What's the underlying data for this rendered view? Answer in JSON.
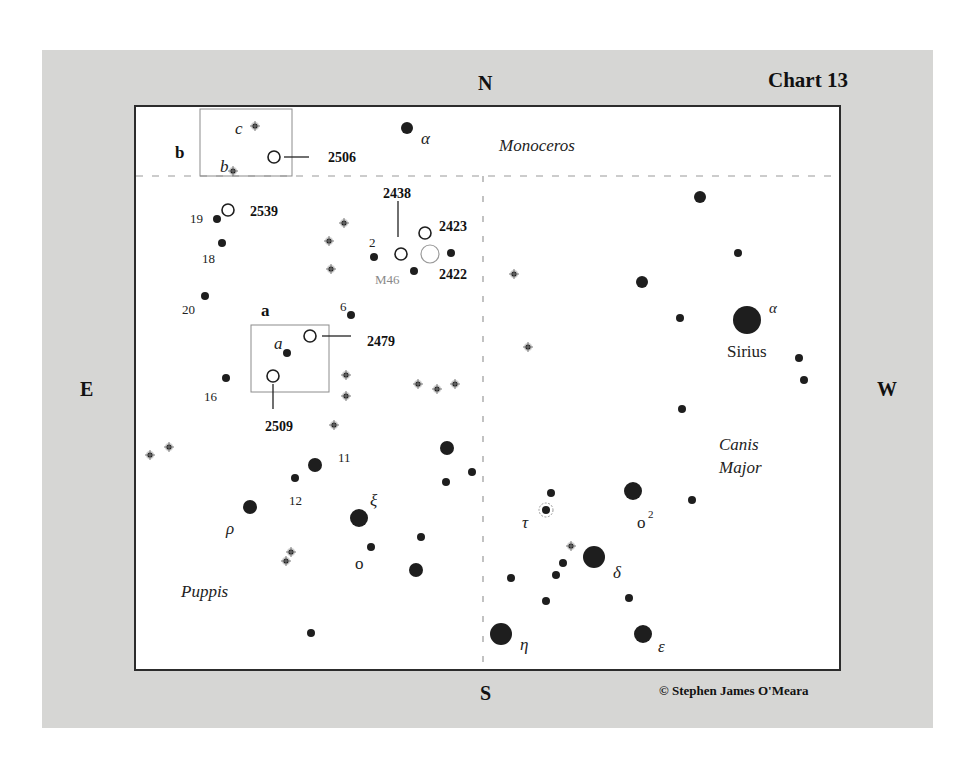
{
  "chart": {
    "title": "Chart 13",
    "copyright": "© Stephen James O'Meara",
    "directions": {
      "north": "N",
      "south": "S",
      "east": "E",
      "west": "W"
    },
    "colors": {
      "panel": "#d6d6d4",
      "frame": "#2c2c2c",
      "star": "#1e1e1e",
      "cluster": "#1e1e1e",
      "m46": "#8a8a8a"
    }
  },
  "constellations": [
    {
      "name": "Monoceros",
      "x": 499,
      "y": 151
    },
    {
      "name": "Canis",
      "x": 719,
      "y": 450
    },
    {
      "name": "Major",
      "x": 719,
      "y": 473
    },
    {
      "name": "Puppis",
      "x": 181,
      "y": 597
    }
  ],
  "insets": [
    {
      "label": "b",
      "label_x": 175,
      "label_y": 158,
      "x": 200,
      "y": 109,
      "w": 92,
      "h": 67
    },
    {
      "label": "a",
      "label_x": 261,
      "label_y": 316,
      "x": 251,
      "y": 325,
      "w": 78,
      "h": 67
    }
  ],
  "clusters": [
    {
      "id": "2506",
      "x": 274,
      "y": 157,
      "r": 6,
      "label_x": 328,
      "label_y": 162,
      "leader": [
        284,
        157,
        309,
        157
      ]
    },
    {
      "id": "2539",
      "x": 228,
      "y": 210,
      "r": 6,
      "label_x": 250,
      "label_y": 216,
      "leader": null
    },
    {
      "id": "2438",
      "x": 401,
      "y": 254,
      "r": 6,
      "label_x": 383,
      "label_y": 198,
      "leader": [
        398,
        201,
        398,
        237
      ]
    },
    {
      "id": "2423",
      "x": 425,
      "y": 233,
      "r": 6,
      "label_x": 439,
      "label_y": 231,
      "leader": null
    },
    {
      "id": "M46",
      "x": 430,
      "y": 254,
      "r": 9,
      "label_x": 375,
      "label_y": 284,
      "leader": null,
      "faint": true
    },
    {
      "id": "2422",
      "x": 0,
      "y": 0,
      "r": 0,
      "label_x": 439,
      "label_y": 279,
      "leader": null,
      "label_only": true
    },
    {
      "id": "2479",
      "x": 310,
      "y": 336,
      "r": 6,
      "label_x": 367,
      "label_y": 346,
      "leader": [
        322,
        336,
        351,
        336
      ]
    },
    {
      "id": "2509",
      "x": 273,
      "y": 376,
      "r": 6,
      "label_x": 265,
      "label_y": 431,
      "leader": [
        273,
        384,
        273,
        409
      ]
    }
  ],
  "stars": [
    {
      "x": 407,
      "y": 128,
      "r": 6
    },
    {
      "x": 217,
      "y": 219,
      "r": 4
    },
    {
      "x": 222,
      "y": 243,
      "r": 4
    },
    {
      "x": 205,
      "y": 296,
      "r": 4
    },
    {
      "x": 374,
      "y": 257,
      "r": 4
    },
    {
      "x": 414,
      "y": 271,
      "r": 4
    },
    {
      "x": 451,
      "y": 253,
      "r": 4
    },
    {
      "x": 351,
      "y": 315,
      "r": 4
    },
    {
      "x": 287,
      "y": 353,
      "r": 4
    },
    {
      "x": 226,
      "y": 378,
      "r": 4
    },
    {
      "x": 700,
      "y": 197,
      "r": 6
    },
    {
      "x": 738,
      "y": 253,
      "r": 4
    },
    {
      "x": 642,
      "y": 282,
      "r": 6
    },
    {
      "x": 680,
      "y": 318,
      "r": 4
    },
    {
      "x": 747,
      "y": 320,
      "r": 14
    },
    {
      "x": 799,
      "y": 358,
      "r": 4
    },
    {
      "x": 804,
      "y": 380,
      "r": 4
    },
    {
      "x": 682,
      "y": 409,
      "r": 4
    },
    {
      "x": 447,
      "y": 448,
      "r": 7
    },
    {
      "x": 472,
      "y": 472,
      "r": 4
    },
    {
      "x": 446,
      "y": 482,
      "r": 4
    },
    {
      "x": 315,
      "y": 465,
      "r": 7
    },
    {
      "x": 295,
      "y": 478,
      "r": 4
    },
    {
      "x": 250,
      "y": 507,
      "r": 7
    },
    {
      "x": 359,
      "y": 518,
      "r": 9
    },
    {
      "x": 371,
      "y": 547,
      "r": 4
    },
    {
      "x": 421,
      "y": 537,
      "r": 4
    },
    {
      "x": 416,
      "y": 570,
      "r": 7
    },
    {
      "x": 311,
      "y": 633,
      "r": 4
    },
    {
      "x": 551,
      "y": 493,
      "r": 4
    },
    {
      "x": 633,
      "y": 491,
      "r": 9
    },
    {
      "x": 692,
      "y": 500,
      "r": 4
    },
    {
      "x": 594,
      "y": 557,
      "r": 11
    },
    {
      "x": 563,
      "y": 563,
      "r": 4
    },
    {
      "x": 556,
      "y": 575,
      "r": 4
    },
    {
      "x": 511,
      "y": 578,
      "r": 4
    },
    {
      "x": 546,
      "y": 601,
      "r": 4
    },
    {
      "x": 629,
      "y": 598,
      "r": 4
    },
    {
      "x": 501,
      "y": 634,
      "r": 11
    },
    {
      "x": 643,
      "y": 634,
      "r": 9
    }
  ],
  "doubles": [
    {
      "x": 255,
      "y": 126
    },
    {
      "x": 233,
      "y": 171
    },
    {
      "x": 344,
      "y": 223
    },
    {
      "x": 329,
      "y": 241
    },
    {
      "x": 331,
      "y": 269
    },
    {
      "x": 514,
      "y": 274
    },
    {
      "x": 528,
      "y": 347
    },
    {
      "x": 346,
      "y": 375
    },
    {
      "x": 346,
      "y": 396
    },
    {
      "x": 334,
      "y": 425
    },
    {
      "x": 418,
      "y": 384
    },
    {
      "x": 437,
      "y": 389
    },
    {
      "x": 455,
      "y": 384
    },
    {
      "x": 150,
      "y": 455
    },
    {
      "x": 169,
      "y": 447
    },
    {
      "x": 291,
      "y": 552
    },
    {
      "x": 286,
      "y": 561
    },
    {
      "x": 571,
      "y": 546
    }
  ],
  "variable": {
    "x": 546,
    "y": 510,
    "r": 4,
    "ring": 7
  },
  "labels": [
    {
      "text": "α",
      "x": 421,
      "y": 144,
      "italic": true,
      "size": 17
    },
    {
      "text": "c",
      "x": 235,
      "y": 134,
      "italic": true,
      "size": 17
    },
    {
      "text": "b",
      "x": 220,
      "y": 172,
      "italic": true,
      "size": 17
    },
    {
      "text": "19",
      "x": 190,
      "y": 223,
      "size": 13
    },
    {
      "text": "18",
      "x": 202,
      "y": 263,
      "size": 13
    },
    {
      "text": "20",
      "x": 182,
      "y": 314,
      "size": 13
    },
    {
      "text": "2",
      "x": 369,
      "y": 247,
      "size": 13
    },
    {
      "text": "6",
      "x": 340,
      "y": 311,
      "size": 13
    },
    {
      "text": "a",
      "x": 274,
      "y": 349,
      "italic": true,
      "size": 17
    },
    {
      "text": "16",
      "x": 204,
      "y": 401,
      "size": 13
    },
    {
      "text": "11",
      "x": 338,
      "y": 462,
      "size": 13
    },
    {
      "text": "12",
      "x": 289,
      "y": 505,
      "size": 13
    },
    {
      "text": "ρ",
      "x": 226,
      "y": 534,
      "italic": true,
      "size": 17
    },
    {
      "text": "ξ",
      "x": 370,
      "y": 506,
      "italic": true,
      "size": 17
    },
    {
      "text": "o",
      "x": 355,
      "y": 569,
      "size": 17
    },
    {
      "text": "α",
      "x": 769,
      "y": 313,
      "italic": true,
      "size": 15
    },
    {
      "text": "Sirius",
      "x": 727,
      "y": 357,
      "size": 17
    },
    {
      "text": "τ",
      "x": 522,
      "y": 528,
      "italic": true,
      "size": 17
    },
    {
      "text": "o",
      "x": 637,
      "y": 528,
      "size": 17
    },
    {
      "text": "2",
      "x": 648,
      "y": 518,
      "size": 11
    },
    {
      "text": "δ",
      "x": 613,
      "y": 578,
      "italic": true,
      "size": 17
    },
    {
      "text": "η",
      "x": 520,
      "y": 650,
      "italic": true,
      "size": 17
    },
    {
      "text": "ε",
      "x": 658,
      "y": 652,
      "italic": true,
      "size": 17
    }
  ]
}
